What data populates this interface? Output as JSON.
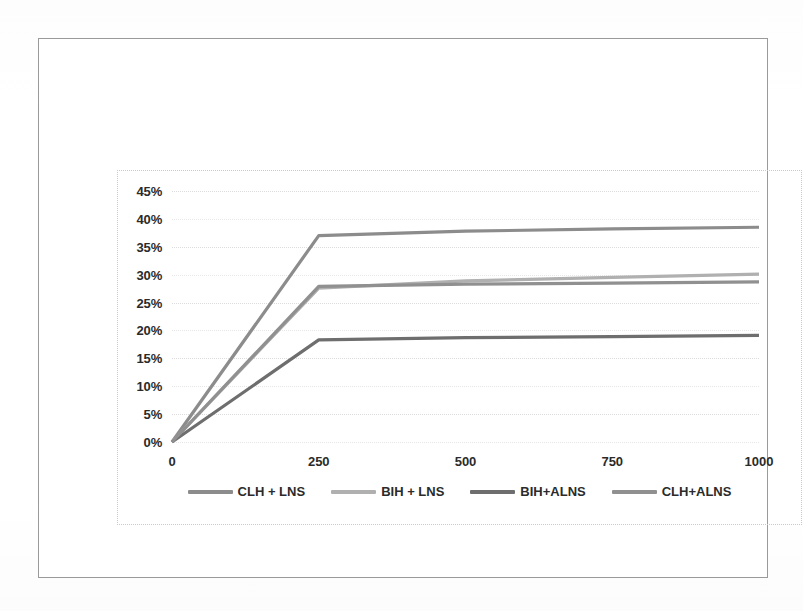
{
  "chart_data": {
    "type": "line",
    "title": "",
    "subtitle": "",
    "xlabel": "",
    "ylabel": "",
    "x": [
      0,
      250,
      500,
      750,
      1000
    ],
    "xticks": [
      "0",
      "250",
      "500",
      "750",
      "1000"
    ],
    "yticks": [
      "0%",
      "5%",
      "10%",
      "15%",
      "20%",
      "25%",
      "30%",
      "35%",
      "40%",
      "45%"
    ],
    "ytick_values": [
      0,
      5,
      10,
      15,
      20,
      25,
      30,
      35,
      40,
      45
    ],
    "xlim": [
      0,
      1000
    ],
    "ylim": [
      0,
      45
    ],
    "grid": "horizontal-dotted",
    "legend_position": "bottom",
    "y_axis_format": "percent",
    "series": [
      {
        "name": "CLH + LNS",
        "color": "#8c8c8c",
        "values": [
          0,
          37.0,
          37.8,
          38.2,
          38.5
        ]
      },
      {
        "name": "BIH + LNS",
        "color": "#b0b0b0",
        "values": [
          0,
          27.6,
          28.9,
          29.5,
          30.1
        ]
      },
      {
        "name": "BIH+ALNS",
        "color": "#6e6e6e",
        "values": [
          0,
          18.3,
          18.7,
          18.9,
          19.1
        ]
      },
      {
        "name": "CLH+ALNS",
        "color": "#909090",
        "values": [
          0,
          27.9,
          28.3,
          28.5,
          28.7
        ]
      }
    ]
  },
  "legend": {
    "items": [
      {
        "label": "CLH + LNS"
      },
      {
        "label": "BIH + LNS"
      },
      {
        "label": "BIH+ALNS"
      },
      {
        "label": "CLH+ALNS"
      }
    ]
  },
  "axes": {
    "y": {
      "labels": [
        "45%",
        "40%",
        "35%",
        "30%",
        "25%",
        "20%",
        "15%",
        "10%",
        "5%",
        "0%"
      ]
    },
    "x": {
      "labels": [
        "0",
        "250",
        "500",
        "750",
        "1000"
      ]
    }
  }
}
